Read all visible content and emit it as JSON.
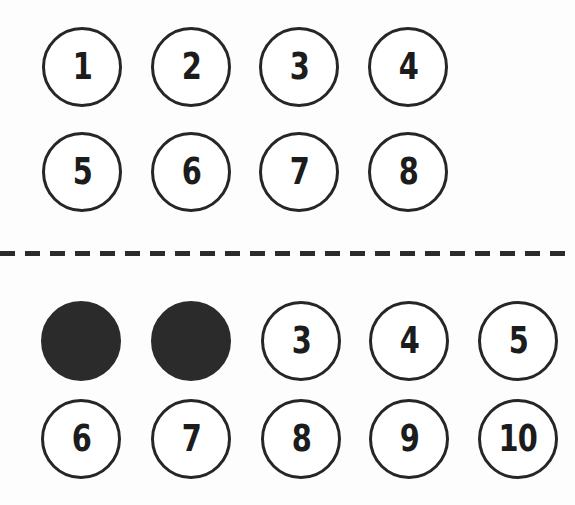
{
  "page": {
    "background_color": "#fdfdfd",
    "stroke_color": "#262626",
    "fill_color": "#2b2b2b"
  },
  "divider": {
    "name": "horizontal-dashed-separator",
    "style": "dashed",
    "color": "#2b2b2b",
    "thickness": 5,
    "dash_length": 15,
    "gap_length": 10
  },
  "groups": [
    {
      "id": "group-top",
      "columns": 4,
      "rows": [
        {
          "id": "top-row-1",
          "circles": [
            {
              "label": "1",
              "filled": false,
              "cx": 82,
              "cy": 67
            },
            {
              "label": "2",
              "filled": false,
              "cx": 191,
              "cy": 67
            },
            {
              "label": "3",
              "filled": false,
              "cx": 299,
              "cy": 67
            },
            {
              "label": "4",
              "filled": false,
              "cx": 408,
              "cy": 67
            }
          ]
        },
        {
          "id": "top-row-2",
          "circles": [
            {
              "label": "5",
              "filled": false,
              "cx": 82,
              "cy": 172
            },
            {
              "label": "6",
              "filled": false,
              "cx": 191,
              "cy": 172
            },
            {
              "label": "7",
              "filled": false,
              "cx": 299,
              "cy": 172
            },
            {
              "label": "8",
              "filled": false,
              "cx": 408,
              "cy": 172
            }
          ]
        }
      ]
    },
    {
      "id": "group-bottom",
      "columns": 5,
      "rows": [
        {
          "id": "bottom-row-1",
          "circles": [
            {
              "label": "1",
              "filled": true,
              "cx": 81,
              "cy": 341
            },
            {
              "label": "2",
              "filled": true,
              "cx": 191,
              "cy": 341
            },
            {
              "label": "3",
              "filled": false,
              "cx": 301,
              "cy": 341
            },
            {
              "label": "4",
              "filled": false,
              "cx": 409,
              "cy": 341
            },
            {
              "label": "5",
              "filled": false,
              "cx": 518,
              "cy": 341
            }
          ]
        },
        {
          "id": "bottom-row-2",
          "circles": [
            {
              "label": "6",
              "filled": false,
              "cx": 81,
              "cy": 439
            },
            {
              "label": "7",
              "filled": false,
              "cx": 191,
              "cy": 439
            },
            {
              "label": "8",
              "filled": false,
              "cx": 301,
              "cy": 439
            },
            {
              "label": "9",
              "filled": false,
              "cx": 409,
              "cy": 439
            },
            {
              "label": "10",
              "filled": false,
              "cx": 518,
              "cy": 439
            }
          ]
        }
      ]
    }
  ]
}
